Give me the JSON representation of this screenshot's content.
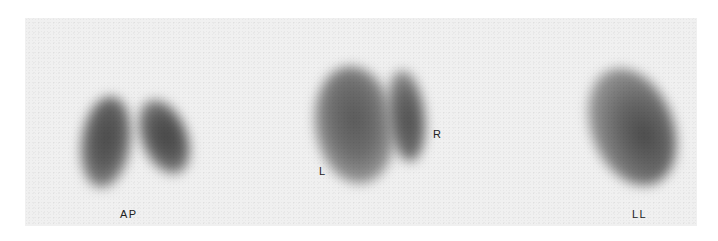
{
  "figure": {
    "background_color": "#f0f0f0",
    "views": [
      {
        "id": "ap",
        "label": "AP"
      },
      {
        "id": "posterior",
        "left_label": "L",
        "right_label": "R"
      },
      {
        "id": "lateral",
        "label": "LL"
      }
    ]
  }
}
